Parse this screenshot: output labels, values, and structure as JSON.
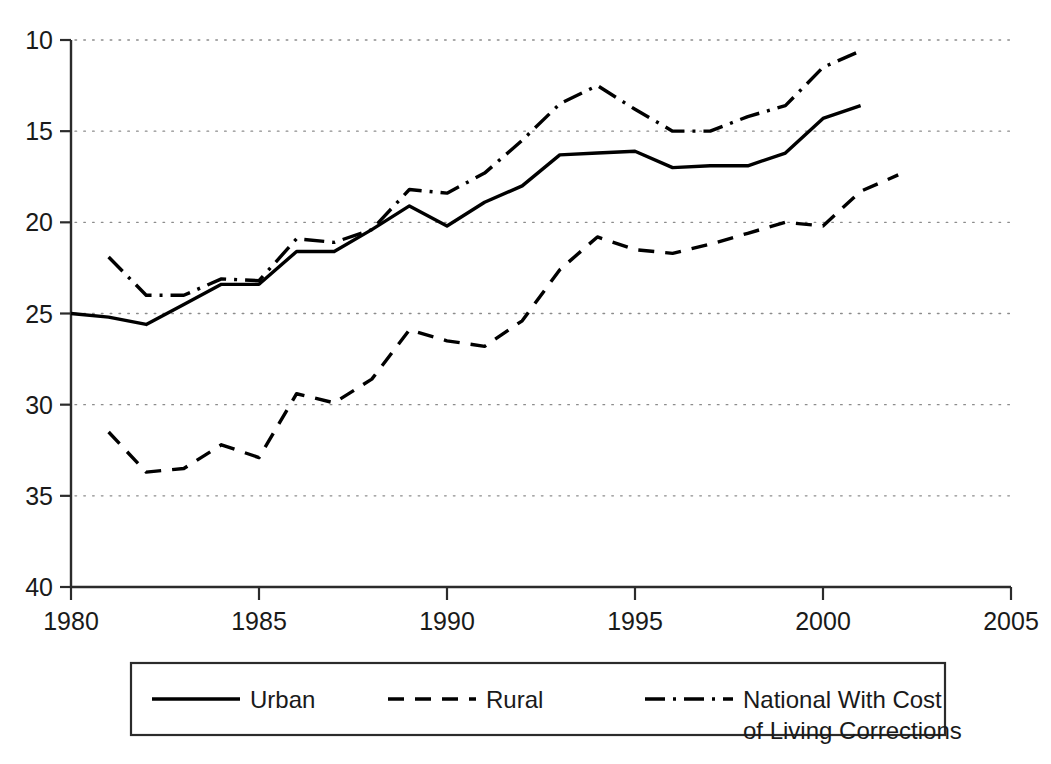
{
  "chart_data": {
    "type": "line",
    "title": "",
    "subtitle": "",
    "xlabel": "",
    "ylabel": "",
    "xlim": [
      1980,
      2005
    ],
    "ylim": [
      10,
      40
    ],
    "xticks": [
      1980,
      1985,
      1990,
      1995,
      2000,
      2005
    ],
    "yticks": [
      10,
      15,
      20,
      25,
      30,
      35,
      40
    ],
    "grid": "horizontal-dotted",
    "legend_position": "below-plot",
    "series": [
      {
        "name": "Urban",
        "style": "solid",
        "color": "#000000",
        "x": [
          1980,
          1981,
          1982,
          1983,
          1984,
          1985,
          1986,
          1987,
          1988,
          1989,
          1990,
          1991,
          1992,
          1993,
          1994,
          1995,
          1996,
          1997,
          1998,
          1999,
          2000,
          2001
        ],
        "values": [
          25.0,
          24.8,
          24.4,
          25.5,
          26.6,
          26.6,
          28.4,
          28.4,
          29.6,
          30.9,
          29.8,
          31.1,
          32.0,
          33.7,
          33.8,
          33.9,
          33.0,
          33.1,
          33.1,
          33.8,
          35.7,
          36.4
        ]
      },
      {
        "name": "Rural",
        "style": "dashed",
        "color": "#000000",
        "x": [
          1981,
          1982,
          1983,
          1984,
          1985,
          1986,
          1987,
          1988,
          1989,
          1990,
          1991,
          1992,
          1993,
          1994,
          1995,
          1996,
          1997,
          1998,
          1999,
          2000,
          2001,
          2002
        ],
        "values": [
          18.5,
          16.3,
          16.5,
          17.8,
          17.1,
          20.6,
          20.1,
          21.4,
          24.1,
          23.5,
          23.2,
          24.6,
          27.4,
          29.2,
          28.5,
          28.3,
          28.8,
          29.4,
          30.0,
          29.8,
          31.7,
          32.6
        ]
      },
      {
        "name": "National With Cost of Living Corrections",
        "style": "dash-dot",
        "color": "#000000",
        "x": [
          1981,
          1982,
          1983,
          1984,
          1985,
          1986,
          1987,
          1988,
          1989,
          1990,
          1991,
          1992,
          1993,
          1994,
          1995,
          1996,
          1997,
          1998,
          1999,
          2000,
          2001
        ],
        "values": [
          28.1,
          26.0,
          26.0,
          26.9,
          26.8,
          29.1,
          28.9,
          29.6,
          31.8,
          31.6,
          32.7,
          34.5,
          36.5,
          37.5,
          36.2,
          35.0,
          35.0,
          35.8,
          36.4,
          38.5,
          39.4
        ]
      }
    ]
  },
  "legend": {
    "entries": [
      {
        "label": "Urban",
        "line_style": "solid"
      },
      {
        "label": "Rural",
        "line_style": "dashed"
      },
      {
        "label": "National With Cost",
        "label2": "of Living Corrections",
        "line_style": "dash-dot"
      }
    ]
  },
  "axes": {
    "y_tick_labels": [
      "40",
      "35",
      "30",
      "25",
      "20",
      "15",
      "10"
    ],
    "x_tick_labels": [
      "1980",
      "1985",
      "1990",
      "1995",
      "2000",
      "2005"
    ]
  },
  "colors": {
    "ink": "#1a1a1a",
    "line": "#000000",
    "grid": "#9a9a9a",
    "background": "#ffffff"
  }
}
